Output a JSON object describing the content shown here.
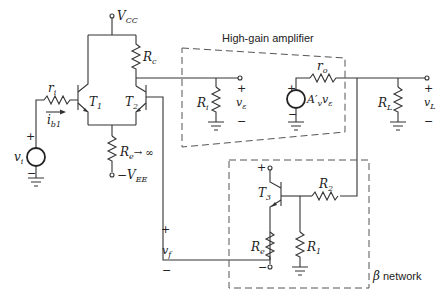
{
  "figure": {
    "blocks": {
      "amplifier_label": "High-gain amplifier",
      "beta_symbol": "β",
      "beta_label": "network"
    },
    "supplies": {
      "vcc": {
        "main": "V",
        "sub": "CC"
      },
      "vee": {
        "main": "−V",
        "sub": "EE"
      }
    },
    "components": {
      "ri_small": {
        "main": "r",
        "sub": "i"
      },
      "ib1": {
        "main": "i",
        "sub": "b1"
      },
      "vi": {
        "main": "v",
        "sub": "i"
      },
      "T1": {
        "main": "T",
        "sub": "1"
      },
      "T2": {
        "main": "T",
        "sub": "2"
      },
      "T3": {
        "main": "T",
        "sub": "3"
      },
      "Rc": {
        "main": "R",
        "sub": "c"
      },
      "Re_tail": {
        "main": "R",
        "sub": "e",
        "suffix": "→ ∞"
      },
      "Ri": {
        "main": "R",
        "sub": "i"
      },
      "v_eps": {
        "main": "v",
        "sub": "ε"
      },
      "ro": {
        "main": "r",
        "sub": "o"
      },
      "Av": {
        "main": "A′",
        "sub": "v",
        "tail": "v",
        "tail_sub": "ε"
      },
      "RL": {
        "main": "R",
        "sub": "L"
      },
      "vL": {
        "main": "v",
        "sub": "L"
      },
      "vf": {
        "main": "v",
        "sub": "f"
      },
      "R2": {
        "main": "R",
        "sub": "2"
      },
      "R1": {
        "main": "R",
        "sub": "1"
      },
      "Re_beta": {
        "main": "R",
        "sub": "e"
      }
    },
    "signs": {
      "plus": "+",
      "minus": "−"
    }
  }
}
